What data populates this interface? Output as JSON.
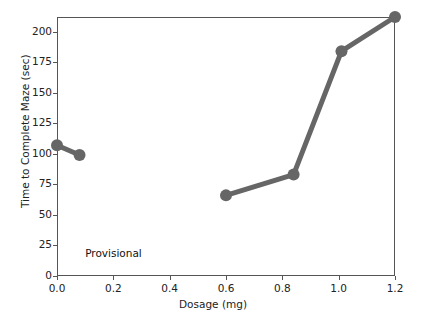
{
  "chart_data": {
    "type": "line",
    "title": "",
    "xlabel": "Dosage (mg)",
    "ylabel": "Time to Complete Maze (sec)",
    "xlim": [
      0.0,
      1.2
    ],
    "ylim": [
      0,
      212
    ],
    "grid": false,
    "legend": null,
    "line_color": "#666666",
    "marker": "circle",
    "marker_color": "#666666",
    "xticks": [
      "0.0",
      "0.2",
      "0.4",
      "0.6",
      "0.8",
      "1.0",
      "1.2"
    ],
    "xtick_values": [
      0.0,
      0.2,
      0.4,
      0.6,
      0.8,
      1.0,
      1.2
    ],
    "yticks": [
      "0",
      "25",
      "50",
      "75",
      "100",
      "125",
      "150",
      "175",
      "200"
    ],
    "ytick_values": [
      0,
      25,
      50,
      75,
      100,
      125,
      150,
      175,
      200
    ],
    "segments": [
      {
        "name": "low-dose-segment",
        "points": [
          {
            "x": 0.0,
            "y": 107
          },
          {
            "x": 0.08,
            "y": 99
          }
        ]
      },
      {
        "name": "dose-response-segment",
        "points": [
          {
            "x": 0.6,
            "y": 66
          },
          {
            "x": 0.84,
            "y": 83
          },
          {
            "x": 1.01,
            "y": 184
          },
          {
            "x": 1.2,
            "y": 212
          }
        ]
      }
    ],
    "x": [
      0.0,
      0.08,
      0.6,
      0.84,
      1.01,
      1.2
    ],
    "values": [
      107,
      99,
      66,
      83,
      184,
      212
    ],
    "annotations": [
      {
        "text": "Provisional",
        "x": 0.1,
        "y": 18
      }
    ]
  }
}
